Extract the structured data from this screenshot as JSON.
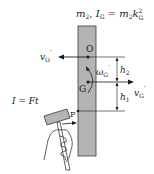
{
  "colors": {
    "rod_fill": "#b4b4b4",
    "rod_stroke": "#3a3a3a",
    "line": "#1a1a1a",
    "hammer_fill": "#b4b4b4"
  },
  "header": {
    "mass": "m",
    "mass_sub": "2",
    "sep": ", ",
    "inertia": "I",
    "inertia_sub": "G",
    "eq": " = ",
    "rhs_m": "m",
    "rhs_m_sub": "2",
    "rhs_k": "k",
    "rhs_k_sub": "G",
    "rhs_k_sup": "2"
  },
  "points": {
    "O": "O",
    "G": "G",
    "P": "P"
  },
  "velocities": {
    "vO": "v",
    "vO_sub": "O",
    "vO_prime": "′",
    "vG": "v",
    "vG_sub": "G",
    "vG_prime": "′",
    "omega": "ω",
    "omega_sub": "G",
    "omega_prime": "′"
  },
  "dimensions": {
    "h2": "h",
    "h2_sub": "2",
    "h1": "h",
    "h1_sub": "1"
  },
  "impulse": {
    "label": "I = Ft"
  }
}
